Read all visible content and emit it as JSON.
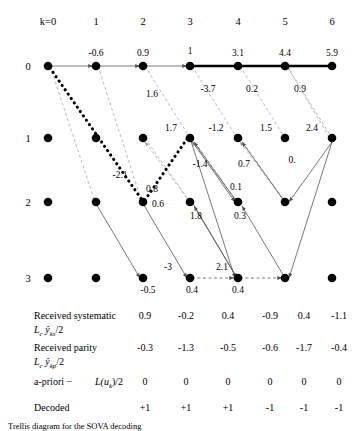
{
  "diagram": {
    "column_headers": [
      "k=0",
      "1",
      "2",
      "3",
      "4",
      "5",
      "6"
    ],
    "row_labels": [
      "0",
      "1",
      "2",
      "3"
    ],
    "state_metrics": [
      {
        "label": "-0.6",
        "col": 1,
        "row": 0
      },
      {
        "label": "0.9",
        "col": 2,
        "row": 0
      },
      {
        "label": "1",
        "col": 3,
        "row": 0
      },
      {
        "label": "3.1",
        "col": 4,
        "row": 0
      },
      {
        "label": "4.4",
        "col": 5,
        "row": 0
      },
      {
        "label": "5.9",
        "col": 6,
        "row": 0
      },
      {
        "label": "1.7",
        "col": 3,
        "row": 1
      },
      {
        "label": "-1.2",
        "col": 4,
        "row": 1
      },
      {
        "label": "1.5",
        "col": 5,
        "row": 1
      },
      {
        "label": "2.4",
        "col": 6,
        "row": 1
      },
      {
        "label": "0.6",
        "col": 2,
        "row": 2
      },
      {
        "label": "1.8",
        "col": 4,
        "row": 2
      },
      {
        "label": "0.3",
        "col": 5,
        "row": 2
      },
      {
        "label": "-0.5",
        "col": 3,
        "row": 3
      },
      {
        "label": "0.4",
        "col": 4,
        "row": 3
      },
      {
        "label": "0.4",
        "col": 5,
        "row": 3
      }
    ],
    "branch_metrics": [
      {
        "label": "1.6",
        "x": 152,
        "y": 97
      },
      {
        "label": "-3.7",
        "x": 208,
        "y": 92
      },
      {
        "label": "0.2",
        "x": 252,
        "y": 92
      },
      {
        "label": "0.9",
        "x": 300,
        "y": 92
      },
      {
        "label": "-2.1",
        "x": 120,
        "y": 178
      },
      {
        "label": "-1.4",
        "x": 200,
        "y": 167
      },
      {
        "label": "0.7",
        "x": 244,
        "y": 167
      },
      {
        "label": "0.",
        "x": 292,
        "y": 163
      },
      {
        "label": "0.8",
        "x": 152,
        "y": 192
      },
      {
        "label": "0.1",
        "x": 236,
        "y": 190
      },
      {
        "label": "-3",
        "x": 168,
        "y": 270
      },
      {
        "label": "2.1",
        "x": 222,
        "y": 270
      }
    ]
  },
  "table": {
    "rows": [
      {
        "name": "received-systematic",
        "label": "Received systematic",
        "formula_lead": "L",
        "formula_sub": "c",
        "formula_y": "y",
        "formula_y_sub": "ks",
        "formula_tail": "/2",
        "values": [
          "0.9",
          "-0.2",
          "0.4",
          "-0.9",
          "0.4",
          "-1.1"
        ]
      },
      {
        "name": "received-parity",
        "label": "Received parity",
        "formula_lead": "L",
        "formula_sub": "c",
        "formula_y": "y",
        "formula_y_sub": "kp",
        "formula_tail": "/2",
        "values": [
          "-0.3",
          "-1.3",
          "-0.5",
          "-0.6",
          "-1.7",
          "-0.4"
        ]
      },
      {
        "name": "a-priori",
        "label": "a-priori −",
        "formula_lead": "L",
        "formula_sub": "",
        "formula_y": "(u",
        "formula_y_sub": "k",
        "formula_tail": ")/2",
        "values": [
          "0",
          "0",
          "0",
          "0",
          "0",
          "0"
        ]
      },
      {
        "name": "decoded",
        "label": "Decoded",
        "formula_lead": "",
        "formula_sub": "",
        "formula_y": "",
        "formula_y_sub": "",
        "formula_tail": "",
        "values": [
          "+1",
          "+1",
          "+1",
          "-1",
          "-1",
          "-1"
        ]
      }
    ]
  },
  "caption": {
    "text": "Trellis diagram for the SOVA decoding"
  },
  "colors": {
    "ink": "#000000",
    "faint": "#9a9a9a",
    "solid_line": "#555555"
  }
}
